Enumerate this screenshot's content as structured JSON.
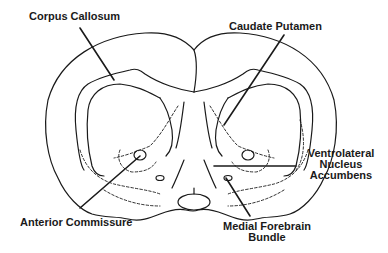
{
  "diagram": {
    "line_color": "#1a1a1a",
    "background": "#ffffff",
    "labels": {
      "corpus_callosum": "Corpus Callosum",
      "caudate_putamen": "Caudate Putamen",
      "ventrolateral_line1": "Ventrolateral",
      "ventrolateral_line2": "Nucleus",
      "ventrolateral_line3": "Accumbens",
      "anterior_commissure": "Anterior Commissure",
      "mfb_line1": "Medial Forebrain",
      "mfb_line2": "Bundle"
    }
  }
}
